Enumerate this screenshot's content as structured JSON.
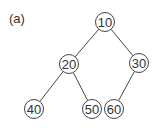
{
  "label": "(a)",
  "colors": {
    "stroke": "#444444",
    "text": "#333333",
    "fill": "#ffffff"
  },
  "tree": {
    "nodes": [
      {
        "id": "10",
        "value": "10",
        "x": 105,
        "y": 22
      },
      {
        "id": "20",
        "value": "20",
        "x": 69,
        "y": 64
      },
      {
        "id": "30",
        "value": "30",
        "x": 139,
        "y": 63
      },
      {
        "id": "40",
        "value": "40",
        "x": 34,
        "y": 109
      },
      {
        "id": "50",
        "value": "50",
        "x": 92,
        "y": 109
      },
      {
        "id": "60",
        "value": "60",
        "x": 114,
        "y": 109
      }
    ],
    "edges": [
      {
        "from": "10",
        "to": "20"
      },
      {
        "from": "10",
        "to": "30"
      },
      {
        "from": "20",
        "to": "40"
      },
      {
        "from": "20",
        "to": "50"
      },
      {
        "from": "30",
        "to": "60"
      }
    ]
  }
}
